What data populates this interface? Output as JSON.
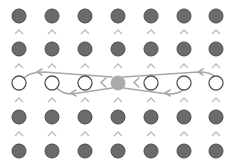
{
  "diagram": {
    "width": 235,
    "height": 167,
    "columns": [
      19,
      52,
      85,
      118,
      151,
      184,
      216
    ],
    "rows": [
      16,
      49,
      83,
      117,
      151
    ],
    "chevron_rows": [
      32,
      66,
      100,
      134
    ],
    "highlight_row_index": 2,
    "center_column_index": 3,
    "colors": {
      "filled_node": "#6b6b6b",
      "filled_stroke": "#4a4a4a",
      "hollow_stroke": "#555555",
      "center_node": "#aaaaaa",
      "chevron": "#bbbbbb",
      "arc": "#a8a8a8"
    },
    "node_radius": 7,
    "nodes_legend": {
      "filled": "filled-node",
      "hollow": "hollow-node",
      "center": "center-node"
    }
  }
}
